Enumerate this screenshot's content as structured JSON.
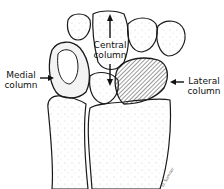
{
  "figure": {
    "labels": {
      "central": [
        "Central",
        "column"
      ],
      "medial": [
        "Medial",
        "column"
      ],
      "lateral": [
        "Lateral",
        "column"
      ]
    },
    "signature": "D. Sumner",
    "colors": {
      "outline": "#1a1a1a",
      "stipple": "#8a8a8a",
      "hatch": "#333333",
      "background": "#ffffff"
    }
  }
}
